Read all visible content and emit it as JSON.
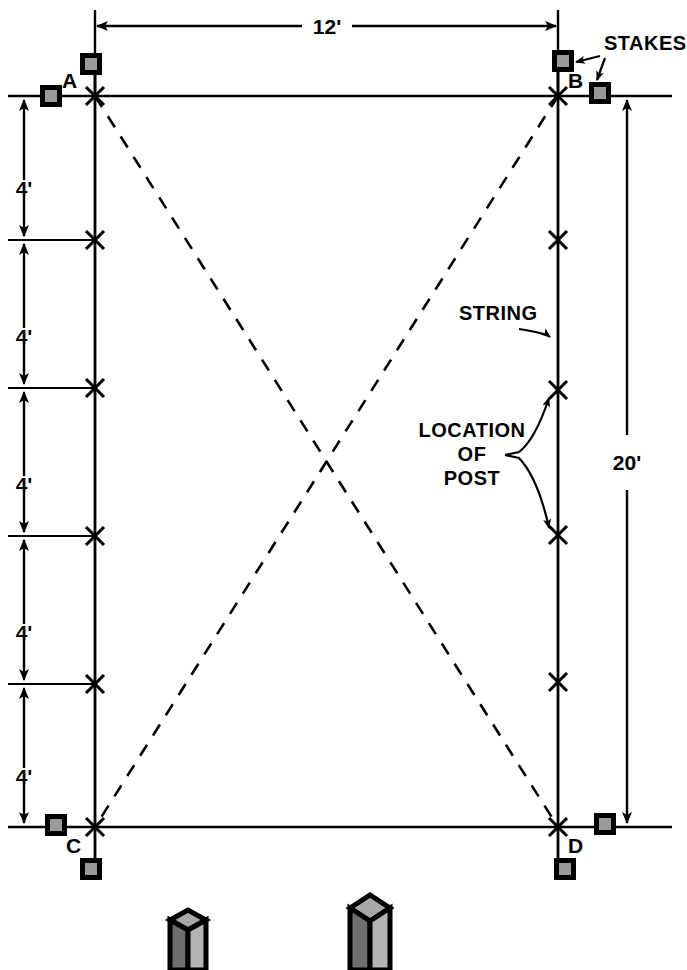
{
  "figure": {
    "type": "construction-layout-diagram"
  },
  "dimensions": {
    "width_label": "12'",
    "height_label": "20'",
    "segment_labels": [
      "4'",
      "4'",
      "4'",
      "4'",
      "4'"
    ]
  },
  "corners": {
    "a": "A",
    "b": "B",
    "c": "C",
    "d": "D"
  },
  "annotations": {
    "stakes": "STAKES",
    "string": "STRING",
    "location_line1": "LOCATION",
    "location_line2": "OF",
    "location_line3": "POST"
  },
  "colors": {
    "line": "#000000",
    "stake_fill": "#9a9a9a",
    "post_light": "#b4b4b4",
    "post_dark": "#6e6e6e",
    "post_top": "#a8a8a8",
    "background": "#ffffff"
  },
  "geometry": {
    "rect": {
      "left": 95,
      "right": 558,
      "top": 96,
      "bottom": 827
    },
    "post_marks_y": [
      240,
      388,
      536,
      684
    ],
    "dim_line_top_y": 26,
    "dim_line_right_x": 627
  },
  "posts": [
    {
      "name": "short-post",
      "x": 170,
      "top": 908
    },
    {
      "name": "tall-post",
      "x": 350,
      "top": 893
    }
  ]
}
